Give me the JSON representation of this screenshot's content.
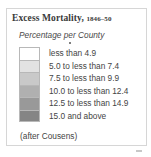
{
  "legend": {
    "title": "Excess Mortality,",
    "title_years": "1846–50",
    "subtitle": "Percentage per County",
    "items": [
      {
        "label": "less than 4.9",
        "color": "#ffffff"
      },
      {
        "label": "5.0 to less than 7.4",
        "color": "#e2e2e2"
      },
      {
        "label": "7.5 to less than 9.9",
        "color": "#c9c9c9"
      },
      {
        "label": "10.0 to less than 12.4",
        "color": "#b0b0b0"
      },
      {
        "label": "12.5 to less than 14.9",
        "color": "#999999"
      },
      {
        "label": "15.0 and above",
        "color": "#858585"
      }
    ],
    "source": "(after Cousens)"
  }
}
